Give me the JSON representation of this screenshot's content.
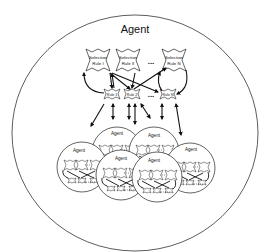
{
  "diagram": {
    "outer_agent_label": "Agent",
    "selection_rules": [
      {
        "line1": "Selection",
        "line2": "Rule I"
      },
      {
        "line1": "Selection",
        "line2": "Rule II"
      },
      {
        "line1": "Selection",
        "line2": "Rule N"
      }
    ],
    "selection_ellipsis": "...",
    "rules": [
      "Rule 1",
      "Rule 2",
      "Rule N"
    ],
    "rules_ellipsis": "...",
    "inner_agents": [
      "Agent",
      "Agent",
      "Agent",
      "Agent",
      "Agent",
      "Agent"
    ],
    "colors": {
      "stroke": "#222222",
      "background": "#ffffff"
    }
  }
}
